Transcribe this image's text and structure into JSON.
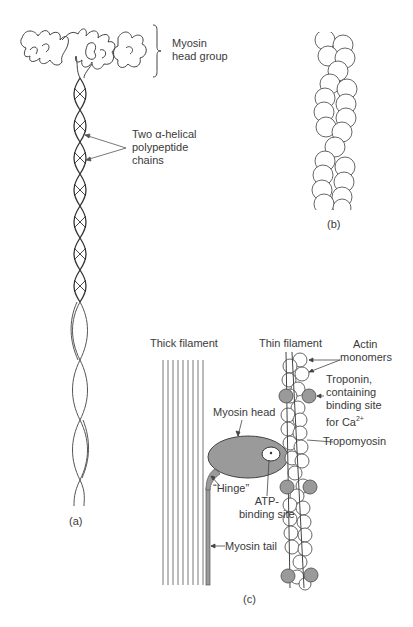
{
  "figure": {
    "panel_a": {
      "label": "(a)",
      "head_group_label_line1": "Myosin",
      "head_group_label_line2": "head group",
      "helix_label_line1": "Two α-helical",
      "helix_label_line2": "polypeptide",
      "helix_label_line3": "chains"
    },
    "panel_b": {
      "label": "(b)"
    },
    "panel_c": {
      "label": "(c)",
      "thick_filament": "Thick filament",
      "thin_filament": "Thin filament",
      "actin_line1": "Actin",
      "actin_line2": "monomers",
      "troponin_line1": "Troponin,",
      "troponin_line2": "containing",
      "troponin_line3": "binding site",
      "troponin_line4": "for Ca",
      "troponin_sup": "2+",
      "tropomyosin": "Tropomyosin",
      "myosin_head": "Myosin head",
      "hinge": "“Hinge”",
      "atp_line1": "ATP-",
      "atp_line2": "binding site",
      "myosin_tail": "Myosin tail"
    },
    "colors": {
      "line": "#444444",
      "shade": "#9a9a9a",
      "background": "#ffffff"
    }
  }
}
